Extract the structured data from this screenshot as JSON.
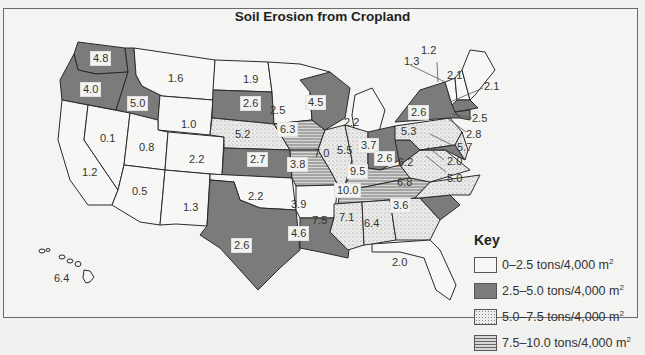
{
  "title": "Soil Erosion from Cropland",
  "colors": {
    "class_0_2_5": "#f7f7f5",
    "class_2_5_5_0": "#7b7b7b",
    "class_5_0_7_5": "#e4e4e0",
    "class_7_5_10_0": "#bcbcbc",
    "border": "#2a2a2a"
  },
  "key": {
    "title": "Key",
    "items": [
      {
        "label": "0–2.5 tons/4,000 m",
        "sup": "2",
        "class": "light"
      },
      {
        "label": "2.5–5.0 tons/4,000 m",
        "sup": "2",
        "class": "dark"
      },
      {
        "label": "5.0–7.5 tons/4,000 m",
        "sup": "2",
        "class": "dotted"
      },
      {
        "label": "7.5–10.0 tons/4,000 m",
        "sup": "2",
        "class": "striped"
      }
    ]
  },
  "states": [
    {
      "name": "Washington",
      "value": "4.8"
    },
    {
      "name": "Oregon",
      "value": "4.0"
    },
    {
      "name": "Idaho",
      "value": "5.0"
    },
    {
      "name": "Montana",
      "value": "1.6"
    },
    {
      "name": "Wyoming",
      "value": "1.0"
    },
    {
      "name": "Nevada",
      "value": "0.1"
    },
    {
      "name": "Utah",
      "value": "0.8"
    },
    {
      "name": "California",
      "value": "1.2"
    },
    {
      "name": "Colorado",
      "value": "2.2"
    },
    {
      "name": "Arizona",
      "value": "0.5"
    },
    {
      "name": "New Mexico",
      "value": "1.3"
    },
    {
      "name": "North Dakota",
      "value": "1.9"
    },
    {
      "name": "South Dakota",
      "value": "2.6"
    },
    {
      "name": "Nebraska",
      "value": "5.2"
    },
    {
      "name": "Kansas",
      "value": "2.7"
    },
    {
      "name": "Oklahoma",
      "value": "2.2"
    },
    {
      "name": "Texas",
      "value": "2.6"
    },
    {
      "name": "Minnesota",
      "value": "2.5"
    },
    {
      "name": "Iowa",
      "value": "6.3"
    },
    {
      "name": "Missouri",
      "value": "3.8"
    },
    {
      "name": "Arkansas",
      "value": "3.9"
    },
    {
      "name": "Louisiana",
      "value": "4.6"
    },
    {
      "name": "Wisconsin",
      "value": "4.5"
    },
    {
      "name": "Illinois",
      "value": "7.0"
    },
    {
      "name": "Michigan",
      "value": "2.2"
    },
    {
      "name": "Indiana",
      "value": "5.5"
    },
    {
      "name": "Ohio",
      "value": "3.7"
    },
    {
      "name": "Kentucky",
      "value": "9.5"
    },
    {
      "name": "Tennessee",
      "value": "10.0"
    },
    {
      "name": "Mississippi",
      "value": "7.5"
    },
    {
      "name": "Alabama",
      "value": "7.1"
    },
    {
      "name": "Georgia",
      "value": "6.4"
    },
    {
      "name": "Florida",
      "value": "2.0"
    },
    {
      "name": "South Carolina",
      "value": "3.6"
    },
    {
      "name": "North Carolina",
      "value": "6.8"
    },
    {
      "name": "Virginia",
      "value": "6.2"
    },
    {
      "name": "West Virginia",
      "value": "2.6"
    },
    {
      "name": "Pennsylvania",
      "value": "5.3"
    },
    {
      "name": "New York",
      "value": "2.6"
    },
    {
      "name": "Vermont",
      "value": "1.3"
    },
    {
      "name": "New Hampshire",
      "value": "1.2"
    },
    {
      "name": "Maine",
      "value": "2.1"
    },
    {
      "name": "Massachusetts",
      "value": "2.1"
    },
    {
      "name": "Rhode Island",
      "value": "2.5"
    },
    {
      "name": "Connecticut",
      "value": "2.8"
    },
    {
      "name": "New Jersey",
      "value": "5.7"
    },
    {
      "name": "Delaware",
      "value": "2.0"
    },
    {
      "name": "Maryland",
      "value": "5.0"
    },
    {
      "name": "Hawaii",
      "value": "6.4"
    }
  ]
}
